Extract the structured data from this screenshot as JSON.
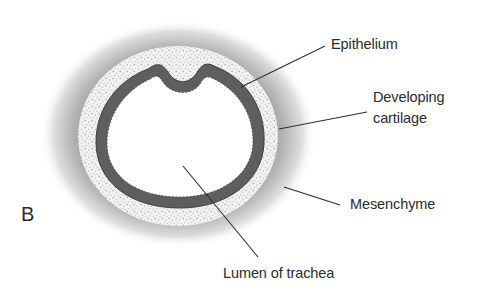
{
  "figure": {
    "panel_letter": "B"
  },
  "labels": {
    "epithelium": "Epithelium",
    "cartilage_line1": "Developing",
    "cartilage_line2": "cartilage",
    "mesenchyme": "Mesenchyme",
    "lumen": "Lumen of trachea"
  },
  "colors": {
    "epithelium": "#5e5e5e",
    "cartilage": "#eeeeee",
    "mesenchyme": "#9a9a9a",
    "lumen": "#ffffff",
    "text": "#2b2b2b"
  }
}
